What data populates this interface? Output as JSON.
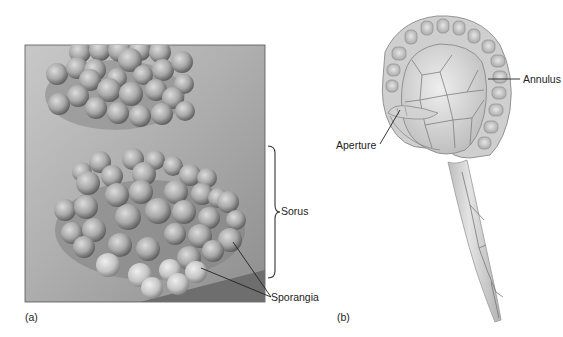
{
  "figure": {
    "panel_a": {
      "label": "(a)",
      "description": "Scanning electron micrograph of fern sori with clustered sporangia",
      "annotations": [
        {
          "text": "Sorus",
          "pointer": "brace"
        },
        {
          "text": "Sporangia",
          "pointer": "leader-lines"
        }
      ]
    },
    "panel_b": {
      "label": "(b)",
      "description": "Illustration of a single sporangium on a stalk",
      "annotations": [
        {
          "text": "Annulus",
          "pointer": "leader-line"
        },
        {
          "text": "Aperture",
          "pointer": "leader-line"
        }
      ]
    }
  },
  "colors": {
    "photo_bg": "#a9a9a9",
    "photo_dark": "#6f6f6f",
    "sphere": "#9c9c9c",
    "sphere_light": "#d4d4d4",
    "drawing_fill": "#d9d9d9",
    "drawing_line": "#7a7a7a",
    "label_text": "#222222"
  }
}
